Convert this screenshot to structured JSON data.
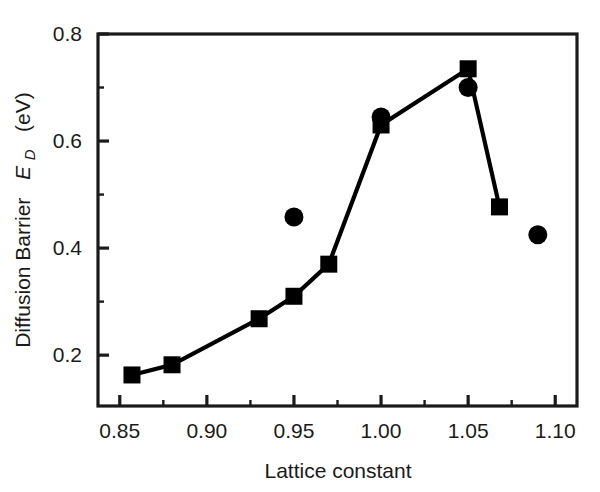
{
  "figure": {
    "background_color": "#ffffff",
    "ink_color": "#1a1a1a"
  },
  "axes": {
    "x_title": "Lattice constant",
    "y_title_main": "Diffusion Barrier",
    "y_title_symbol": "E",
    "y_title_subscript": "D",
    "y_title_units": "(eV)",
    "x_tick_labels": [
      "0.85",
      "0.90",
      "0.95",
      "1.00",
      "1.05",
      "1.10"
    ],
    "y_tick_labels": [
      "0.2",
      "0.4",
      "0.6",
      "0.8"
    ]
  },
  "chart_data": {
    "type": "line",
    "title": "",
    "xlabel": "Lattice constant",
    "ylabel": "Diffusion Barrier E_D (eV)",
    "xlim": [
      0.8375,
      1.1125
    ],
    "ylim": [
      0.105,
      0.8
    ],
    "xticks": [
      0.85,
      0.9,
      0.95,
      1.0,
      1.05,
      1.1
    ],
    "yticks": [
      0.2,
      0.4,
      0.6,
      0.8
    ],
    "x_minor_tick_step": 0.025,
    "y_minor_tick_step": 0.1,
    "grid": false,
    "legend": null,
    "series": [
      {
        "name": "squares-connected",
        "marker": "square",
        "connected": true,
        "color": "#000000",
        "x": [
          0.857,
          0.88,
          0.93,
          0.95,
          0.97,
          1.0,
          1.05,
          1.068
        ],
        "y": [
          0.163,
          0.182,
          0.268,
          0.31,
          0.37,
          0.63,
          0.735,
          0.477
        ]
      },
      {
        "name": "circles-isolated",
        "marker": "circle",
        "connected": false,
        "color": "#000000",
        "x": [
          0.95,
          1.0,
          1.05,
          1.09
        ],
        "y": [
          0.458,
          0.645,
          0.7,
          0.425
        ]
      }
    ]
  }
}
